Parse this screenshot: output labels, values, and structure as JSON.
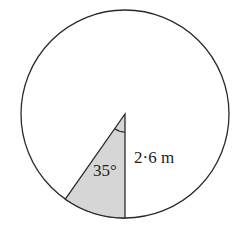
{
  "diagram": {
    "type": "circle-sector",
    "angle_label": "35°",
    "radius_label": "2·6 m",
    "angle_degrees": 35,
    "radius_value": 2.6,
    "radius_unit": "m",
    "colors": {
      "stroke": "#2a2a2a",
      "sector_fill": "#d6d6d6",
      "background": "#ffffff"
    }
  }
}
